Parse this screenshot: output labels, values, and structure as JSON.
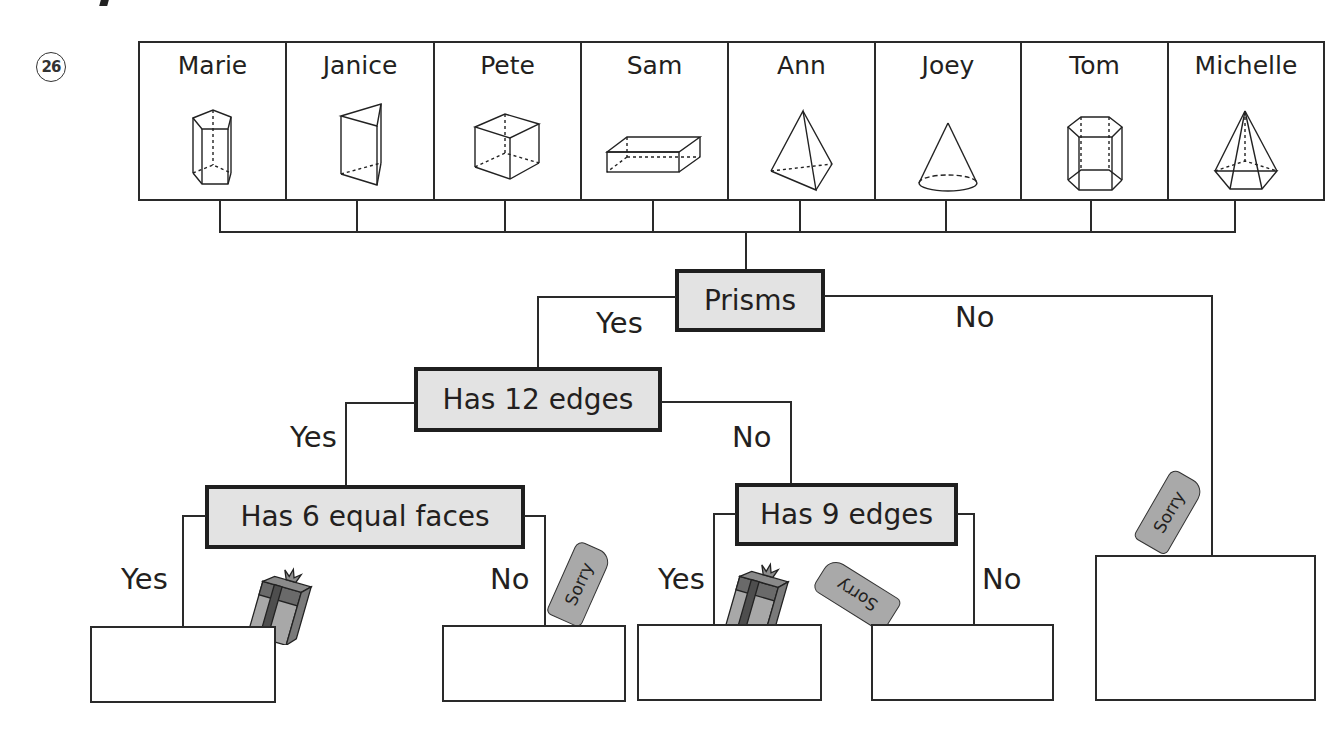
{
  "question_number": "26",
  "people": [
    {
      "name": "Marie",
      "shape": "pentagonal-prism"
    },
    {
      "name": "Janice",
      "shape": "triangular-prism"
    },
    {
      "name": "Pete",
      "shape": "cube"
    },
    {
      "name": "Sam",
      "shape": "rectangular-prism"
    },
    {
      "name": "Ann",
      "shape": "triangular-pyramid"
    },
    {
      "name": "Joey",
      "shape": "cone"
    },
    {
      "name": "Tom",
      "shape": "hexagonal-prism"
    },
    {
      "name": "Michelle",
      "shape": "pentagonal-pyramid"
    }
  ],
  "tree": {
    "root": {
      "label": "Prisms",
      "yes": "Yes",
      "no": "No"
    },
    "level2": {
      "label": "Has 12 edges",
      "yes": "Yes",
      "no": "No"
    },
    "level3_left": {
      "label": "Has 6 equal faces",
      "yes": "Yes",
      "no": "No"
    },
    "level3_right": {
      "label": "Has 9 edges",
      "yes": "Yes",
      "no": "No"
    }
  },
  "tags": {
    "sorry": "Sorry"
  },
  "colors": {
    "node_fill": "#e3e3e3",
    "line": "#2a2a2a",
    "tag_fill": "#a9a9a9",
    "gift_dark": "#5e5e5e",
    "gift_light": "#a8a8a8"
  }
}
